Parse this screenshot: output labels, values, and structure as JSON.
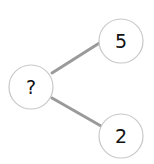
{
  "diagram": {
    "type": "number-bond",
    "colors": {
      "background": "#ffffff",
      "node_stroke": "#c8c8c8",
      "node_fill": "#ffffff",
      "edge": "#9a9a9a",
      "text": "#111111"
    },
    "nodes": [
      {
        "id": "whole",
        "label": "?",
        "cx": 31,
        "cy": 87,
        "r": 22
      },
      {
        "id": "part-top",
        "label": "5",
        "cx": 121,
        "cy": 41,
        "r": 22
      },
      {
        "id": "part-bottom",
        "label": "2",
        "cx": 121,
        "cy": 136,
        "r": 22
      }
    ],
    "edges": [
      {
        "from": "whole",
        "to": "part-top"
      },
      {
        "from": "whole",
        "to": "part-bottom"
      }
    ]
  }
}
